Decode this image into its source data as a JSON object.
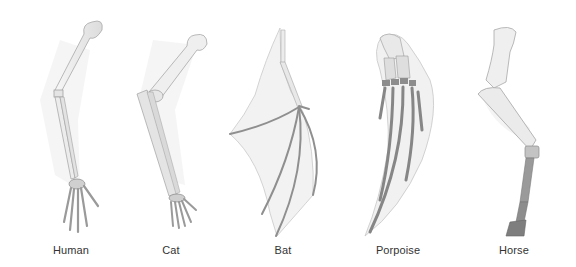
{
  "figure": {
    "colors": {
      "background": "#ffffff",
      "bone_light": "#eeeeee",
      "bone_outline": "#a8a8a8",
      "bone_dark": "#8a8a8a",
      "membrane": "#efefef",
      "shadow": "#e6e6e6",
      "label_text": "#333333"
    },
    "limbs": [
      {
        "id": "human",
        "label": "Human"
      },
      {
        "id": "cat",
        "label": "Cat"
      },
      {
        "id": "bat",
        "label": "Bat"
      },
      {
        "id": "porpoise",
        "label": "Porpoise"
      },
      {
        "id": "horse",
        "label": "Horse"
      }
    ]
  }
}
